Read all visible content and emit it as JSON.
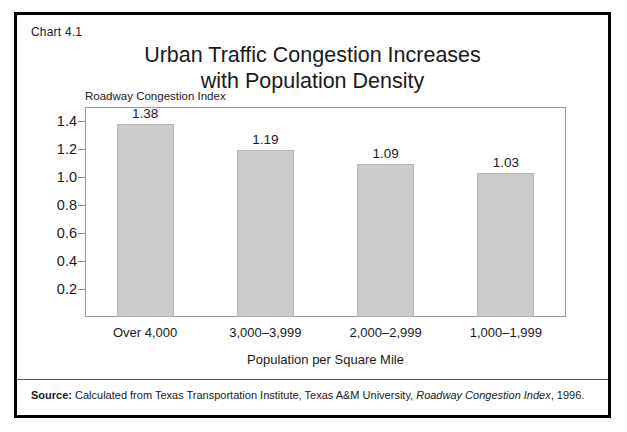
{
  "figure": {
    "chart_number": "Chart 4.1",
    "title_line1": "Urban Traffic Congestion Increases",
    "title_line2": "with Population Density",
    "frame_color": "#000000",
    "bar_color": "#cccccc"
  },
  "source": {
    "label": "Source:",
    "text_before_italic": " Calculated from Texas Transportation Institute, Texas A&M University, ",
    "italic_text": "Roadway Congestion Index",
    "text_after_italic": ", 1996."
  },
  "chart_data": {
    "type": "bar",
    "title": "Urban Traffic Congestion Increases with Population Density",
    "subtitle": "",
    "xlabel": "Population per Square Mile",
    "ylabel": "Roadway Congestion Index",
    "categories": [
      "Over 4,000",
      "3,000–3,999",
      "2,000–2,999",
      "1,000–1,999"
    ],
    "values": [
      1.38,
      1.19,
      1.09,
      1.03
    ],
    "value_labels": [
      "1.38",
      "1.19",
      "1.09",
      "1.03"
    ],
    "ylim": [
      0,
      1.5
    ],
    "yticks": [
      0.2,
      0.4,
      0.6,
      0.8,
      1.0,
      1.2,
      1.4
    ],
    "ytick_labels": [
      "0.2",
      "0.4",
      "0.6",
      "0.8",
      "1.0",
      "1.2",
      "1.4"
    ],
    "grid": false,
    "legend": "none",
    "bar_color": "#cccccc",
    "bar_edge_color": "#b4b4b4"
  }
}
